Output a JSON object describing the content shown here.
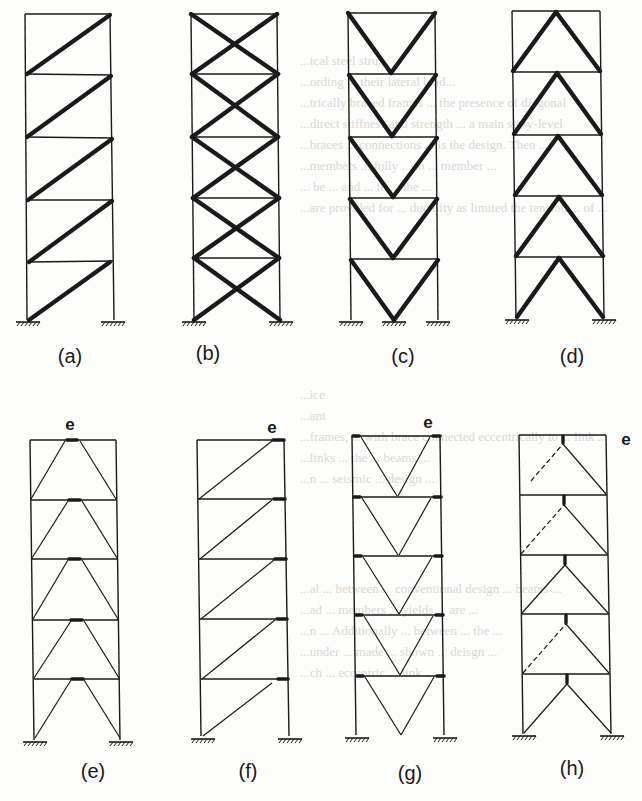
{
  "figure": {
    "background_text_color": "#d9d9d6",
    "ink_color": "#1a1a1a",
    "background_text": [
      "...ical steel stru...",
      "...ording to their lateral load...",
      "...trically braced frames ... the presence of diagonal",
      "...direct stiffness and strength ... a main story-level",
      "...braces ... connections ... is the design. Then ...",
      "...members ... fully ... to ... member ...",
      "... be ... and ... in ... the ...",
      "...are provided for ... ductility as limited the tension ... of ...",
      "...ice",
      "...ant",
      "...frames, ... with brace connected eccentrically to ... link ...",
      "...links ... the ... beams ...",
      "...n ... seismic ... design ...",
      "...al ... between ... conventional design ... beams ...",
      "...ad ... members ... yields ... are ...",
      "...n ... Additionally ... between ... the ...",
      "...under ... made ... shown ... deisgn ...",
      "...ch ... eccentric ... link ..."
    ],
    "panels": [
      {
        "id": "a",
        "label": "(a)",
        "type": "single diagonal brace"
      },
      {
        "id": "b",
        "label": "(b)",
        "type": "X-brace"
      },
      {
        "id": "c",
        "label": "(c)",
        "type": "V-brace"
      },
      {
        "id": "d",
        "label": "(d)",
        "type": "inverted-V (chevron) brace"
      },
      {
        "id": "e",
        "label": "(e)",
        "type": "EBF with central link",
        "link_label": "e"
      },
      {
        "id": "f",
        "label": "(f)",
        "type": "EBF with end link (single diagonal)",
        "link_label": "e"
      },
      {
        "id": "g",
        "label": "(g)",
        "type": "EBF with end links (V-brace)",
        "link_label": "e"
      },
      {
        "id": "h",
        "label": "(h)",
        "type": "EBF with vertical link",
        "link_label": "e"
      }
    ],
    "stories_per_frame": 5
  }
}
